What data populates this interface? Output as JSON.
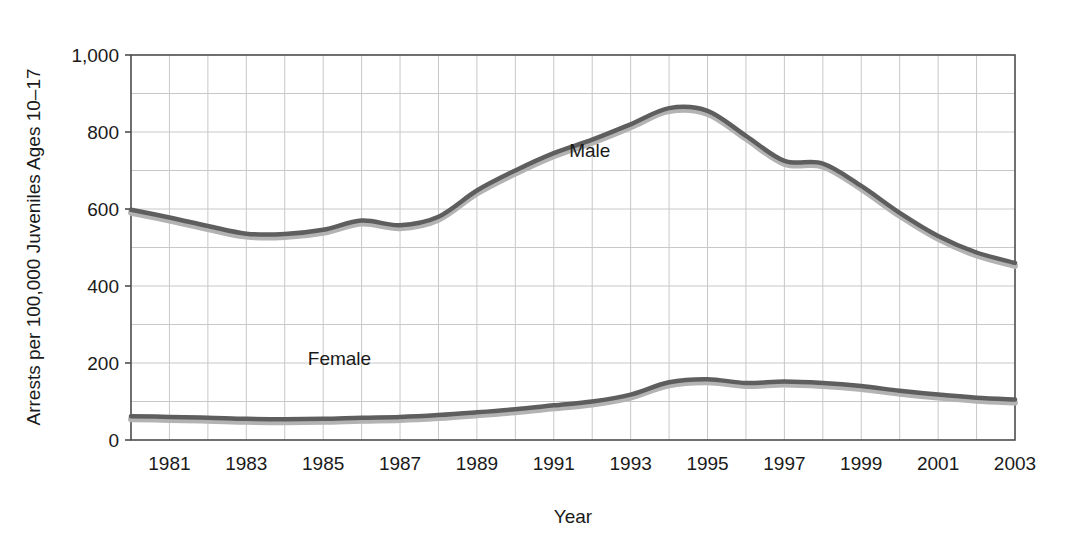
{
  "chart_data": {
    "type": "line",
    "title": "",
    "xlabel": "Year",
    "ylabel": "Arrests per 100,000 Juveniles Ages 10–17",
    "xlim": [
      1980,
      2003
    ],
    "ylim": [
      0,
      1000
    ],
    "grid": true,
    "legend_position": "inline-annotations",
    "y_ticks": [
      0,
      200,
      400,
      600,
      800,
      1000
    ],
    "y_tick_labels": [
      "0",
      "200",
      "400",
      "600",
      "800",
      "1,000"
    ],
    "y_gridlines": [
      0,
      100,
      200,
      300,
      400,
      500,
      600,
      700,
      800,
      900,
      1000
    ],
    "x_ticks": [
      1981,
      1983,
      1985,
      1987,
      1989,
      1991,
      1993,
      1995,
      1997,
      1999,
      2001,
      2003
    ],
    "x_tick_labels": [
      "1981",
      "1983",
      "1985",
      "1987",
      "1989",
      "1991",
      "1993",
      "1995",
      "1997",
      "1999",
      "2001",
      "2003"
    ],
    "x_gridlines": [
      1981,
      1982,
      1983,
      1984,
      1985,
      1986,
      1987,
      1988,
      1989,
      1990,
      1991,
      1992,
      1993,
      1994,
      1995,
      1996,
      1997,
      1998,
      1999,
      2000,
      2001,
      2002
    ],
    "x": [
      1980,
      1981,
      1982,
      1983,
      1984,
      1985,
      1986,
      1987,
      1988,
      1989,
      1990,
      1991,
      1992,
      1993,
      1994,
      1995,
      1996,
      1997,
      1998,
      1999,
      2000,
      2001,
      2002,
      2003
    ],
    "series": [
      {
        "name": "Male",
        "color": "#5e5e5e",
        "shadow_color": "#b3b3b3",
        "label_x": 1991.4,
        "label_y": 735,
        "values": [
          598,
          578,
          556,
          536,
          535,
          546,
          570,
          558,
          580,
          648,
          700,
          745,
          780,
          820,
          862,
          855,
          790,
          725,
          718,
          660,
          590,
          530,
          487,
          460
        ]
      },
      {
        "name": "Female",
        "color": "#5e5e5e",
        "shadow_color": "#b3b3b3",
        "label_x": 1984.6,
        "label_y": 195,
        "values": [
          62,
          60,
          58,
          55,
          54,
          55,
          58,
          60,
          65,
          72,
          80,
          90,
          100,
          118,
          150,
          158,
          148,
          152,
          148,
          140,
          128,
          118,
          110,
          105
        ]
      }
    ],
    "annotations": [
      {
        "text": "Male",
        "x": 1991.4,
        "y": 735
      },
      {
        "text": "Female",
        "x": 1984.6,
        "y": 195
      }
    ]
  },
  "axis_label_vertical": "Arrests per 100,000 Juveniles Ages 10–17",
  "axis_label_horizontal": "Year"
}
